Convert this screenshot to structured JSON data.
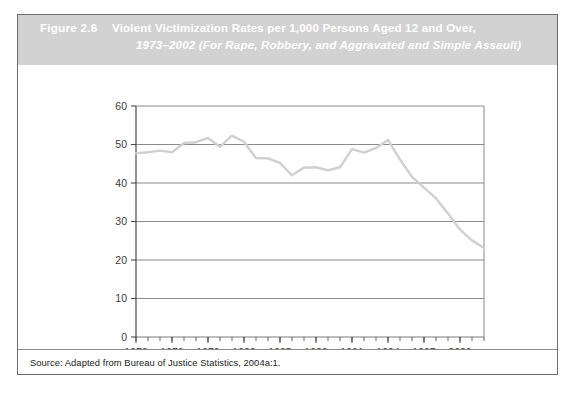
{
  "figure": {
    "number_label": "Figure 2.6",
    "title_line1": "Violent Victimization Rates per 1,000 Persons Aged 12 and Over,",
    "title_line2": "1973–2002 (For Rape, Robbery, and Aggravated and Simple Assault)",
    "source_note": "Source: Adapted from Bureau of Justice Statistics, 2004a:1.",
    "band_color": "#d2d2d2",
    "title_text_color": "#ffffff",
    "border_color": "#6b6b6b"
  },
  "chart_data": {
    "type": "line",
    "title": "Violent Victimization Rates per 1,000 Persons Aged 12 and Over, 1973–2002 (For Rape, Robbery, and Aggravated and Simple Assault)",
    "xlabel": "",
    "ylabel": "",
    "xlim": [
      1973,
      2002
    ],
    "ylim": [
      0,
      60
    ],
    "ytick_values": [
      0,
      10,
      20,
      30,
      40,
      50,
      60
    ],
    "ytick_labels": [
      "0",
      "10",
      "20",
      "30",
      "40",
      "50",
      "60"
    ],
    "xtick_values": [
      1973,
      1976,
      1979,
      1982,
      1985,
      1988,
      1991,
      1994,
      1997,
      2000
    ],
    "xtick_labels": [
      "1973",
      "1976",
      "1979",
      "1982",
      "1985",
      "1988",
      "1991",
      "1994",
      "1997",
      "2000"
    ],
    "grid": "horizontal",
    "grid_color": "#7d7d7d",
    "legend": "none",
    "line_color": "#d0d0d0",
    "line_width": 2.4,
    "x": [
      1973,
      1974,
      1975,
      1976,
      1977,
      1978,
      1979,
      1980,
      1981,
      1982,
      1983,
      1984,
      1985,
      1986,
      1987,
      1988,
      1989,
      1990,
      1991,
      1992,
      1993,
      1994,
      1995,
      1996,
      1997,
      1998,
      1999,
      2000,
      2001,
      2002
    ],
    "values": [
      47.7,
      48.0,
      48.4,
      48.0,
      50.4,
      50.6,
      51.7,
      49.4,
      52.3,
      50.7,
      46.5,
      46.4,
      45.2,
      42.0,
      44.0,
      44.1,
      43.3,
      44.1,
      48.8,
      47.9,
      49.1,
      51.2,
      46.1,
      41.6,
      38.8,
      36.0,
      32.1,
      27.9,
      25.1,
      23.1
    ]
  },
  "icons": {
    "chart_line": "line-chart-icon"
  }
}
